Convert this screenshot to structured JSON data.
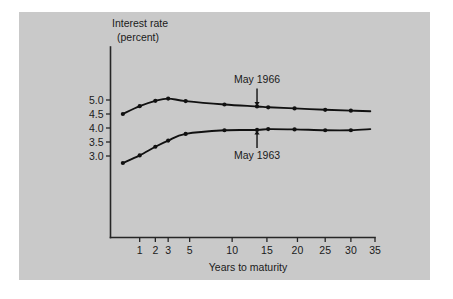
{
  "figure": {
    "background_color": "#ffffff",
    "panel_color": "#c9c9c9",
    "ink_color": "#111111"
  },
  "chart_data": {
    "type": "line",
    "title": "",
    "subtitle": "",
    "xlabel": "Years to maturity",
    "ylabel": "Interest rate (percent)",
    "ylabel_line1": "Interest rate",
    "ylabel_line2": "(percent)",
    "grid": false,
    "legend_position": "inline-annotations",
    "x_scale": "compressed",
    "xticks": [
      1,
      2,
      3,
      5,
      10,
      15,
      20,
      25,
      30,
      35
    ],
    "xticklabels": [
      "1",
      "2",
      "3",
      "5",
      "10",
      "15",
      "20",
      "25",
      "30",
      "35"
    ],
    "yticks": [
      3.0,
      3.5,
      4.0,
      4.5,
      5.0
    ],
    "yticklabels": [
      "3.0",
      "3.5",
      "4.0",
      "4.5",
      "5.0"
    ],
    "xlim": [
      0,
      35
    ],
    "ylim": [
      2.0,
      5.6
    ],
    "annotations": [
      {
        "text": "May 1966",
        "points_to_series": "May 1966",
        "arrow_direction": "down",
        "at_x": 13.5,
        "at_y": 4.77
      },
      {
        "text": "May 1963",
        "points_to_series": "May 1963",
        "arrow_direction": "up",
        "at_x": 13.5,
        "at_y": 3.93
      }
    ],
    "series": [
      {
        "name": "May 1966",
        "x": [
          0.25,
          1,
          2,
          3,
          4.6,
          9,
          13.5,
          15.2,
          19.5,
          25,
          30,
          34
        ],
        "values": [
          4.5,
          4.78,
          4.97,
          5.05,
          4.96,
          4.84,
          4.77,
          4.74,
          4.7,
          4.65,
          4.62,
          4.6
        ],
        "marker": "circle",
        "marker_x": [
          0.25,
          1,
          2,
          3,
          4.6,
          9,
          13.5,
          15.2,
          19.5,
          25,
          30
        ],
        "marker_values": [
          4.5,
          4.78,
          4.97,
          5.05,
          4.96,
          4.84,
          4.77,
          4.74,
          4.7,
          4.65,
          4.62
        ]
      },
      {
        "name": "May 1963",
        "x": [
          0.25,
          1,
          2,
          3,
          4.6,
          9,
          13.5,
          15.2,
          19.5,
          25,
          30,
          34
        ],
        "values": [
          2.75,
          3.02,
          3.33,
          3.55,
          3.79,
          3.92,
          3.93,
          3.96,
          3.95,
          3.92,
          3.92,
          3.96
        ],
        "marker": "circle",
        "marker_x": [
          0.25,
          1,
          2,
          3,
          4.6,
          9,
          13.5,
          15.2,
          19.5,
          25,
          30
        ],
        "marker_values": [
          2.75,
          3.02,
          3.33,
          3.55,
          3.79,
          3.92,
          3.93,
          3.96,
          3.95,
          3.92,
          3.92
        ]
      }
    ]
  }
}
